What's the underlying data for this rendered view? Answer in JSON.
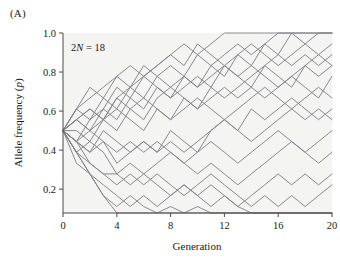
{
  "figure": {
    "panel_label": "(A)",
    "annotation": "2N = 18",
    "annotation_prefix": "2",
    "annotation_var": "N",
    "annotation_suffix": " = 18"
  },
  "chart_data": {
    "type": "line",
    "title": "",
    "xlabel": "Generation",
    "ylabel_prefix": "Allele frequency (",
    "ylabel_var": "p",
    "ylabel_suffix": ")",
    "ylabel": "Allele frequency (p)",
    "annotation": "2N = 18",
    "grid": false,
    "legend": "none",
    "line_color": "#7d7d85",
    "plot_bg": "#f4f4f2",
    "xlim": [
      0,
      20
    ],
    "ylim": [
      0.0778,
      1.0
    ],
    "xticks": [
      0,
      4,
      8,
      12,
      16,
      20
    ],
    "xtick_labels": [
      "0",
      "4",
      "8",
      "12",
      "16",
      "20"
    ],
    "yticks": [
      0.2,
      0.4,
      0.6,
      0.8,
      1.0
    ],
    "ytick_labels": [
      "0.2",
      "0.4",
      "0.6",
      "0.8",
      "1.0"
    ],
    "x": [
      0,
      1,
      2,
      3,
      4,
      5,
      6,
      7,
      8,
      9,
      10,
      11,
      12,
      13,
      14,
      15,
      16,
      17,
      18,
      19,
      20
    ],
    "series": [
      {
        "name": "replicate-1",
        "values": [
          0.5,
          0.611,
          0.667,
          0.722,
          0.778,
          0.833,
          0.778,
          0.833,
          0.889,
          0.944,
          0.889,
          0.944,
          1.0,
          1.0,
          1.0,
          1.0,
          1.0,
          1.0,
          1.0,
          1.0,
          1.0
        ]
      },
      {
        "name": "replicate-2",
        "values": [
          0.5,
          0.556,
          0.611,
          0.556,
          0.667,
          0.722,
          0.667,
          0.778,
          0.833,
          0.778,
          0.889,
          0.833,
          0.889,
          0.944,
          0.889,
          0.944,
          1.0,
          1.0,
          1.0,
          1.0,
          1.0
        ]
      },
      {
        "name": "replicate-3",
        "values": [
          0.5,
          0.611,
          0.556,
          0.667,
          0.611,
          0.722,
          0.778,
          0.722,
          0.667,
          0.778,
          0.722,
          0.833,
          0.778,
          0.889,
          0.833,
          0.944,
          0.889,
          1.0,
          0.944,
          1.0,
          1.0
        ]
      },
      {
        "name": "replicate-4",
        "values": [
          0.5,
          0.444,
          0.556,
          0.611,
          0.722,
          0.667,
          0.778,
          0.833,
          0.889,
          0.833,
          0.944,
          0.889,
          0.833,
          0.889,
          0.944,
          0.889,
          0.833,
          0.889,
          0.944,
          0.889,
          0.944
        ]
      },
      {
        "name": "replicate-5",
        "values": [
          0.5,
          0.556,
          0.5,
          0.611,
          0.556,
          0.667,
          0.611,
          0.722,
          0.667,
          0.722,
          0.778,
          0.722,
          0.833,
          0.778,
          0.722,
          0.833,
          0.889,
          0.833,
          0.889,
          0.833,
          0.889
        ]
      },
      {
        "name": "replicate-6",
        "values": [
          0.5,
          0.611,
          0.722,
          0.667,
          0.778,
          0.722,
          0.833,
          0.778,
          0.722,
          0.667,
          0.611,
          0.722,
          0.667,
          0.722,
          0.778,
          0.833,
          0.778,
          0.722,
          0.833,
          0.889,
          0.833
        ]
      },
      {
        "name": "replicate-7",
        "values": [
          0.5,
          0.444,
          0.5,
          0.556,
          0.5,
          0.611,
          0.556,
          0.667,
          0.722,
          0.778,
          0.722,
          0.778,
          0.833,
          0.778,
          0.833,
          0.778,
          0.722,
          0.778,
          0.833,
          0.778,
          0.833
        ]
      },
      {
        "name": "replicate-8",
        "values": [
          0.5,
          0.556,
          0.611,
          0.556,
          0.667,
          0.611,
          0.667,
          0.611,
          0.556,
          0.667,
          0.611,
          0.667,
          0.722,
          0.667,
          0.722,
          0.667,
          0.722,
          0.778,
          0.722,
          0.667,
          0.778
        ]
      },
      {
        "name": "replicate-9",
        "values": [
          0.5,
          0.5,
          0.444,
          0.556,
          0.611,
          0.556,
          0.5,
          0.611,
          0.556,
          0.611,
          0.667,
          0.611,
          0.556,
          0.611,
          0.667,
          0.722,
          0.667,
          0.611,
          0.667,
          0.722,
          0.667
        ]
      },
      {
        "name": "replicate-10",
        "values": [
          0.5,
          0.444,
          0.389,
          0.5,
          0.444,
          0.389,
          0.444,
          0.389,
          0.5,
          0.444,
          0.389,
          0.5,
          0.556,
          0.5,
          0.611,
          0.556,
          0.611,
          0.667,
          0.611,
          0.556,
          0.611
        ]
      },
      {
        "name": "replicate-11",
        "values": [
          0.5,
          0.556,
          0.5,
          0.444,
          0.389,
          0.444,
          0.389,
          0.444,
          0.389,
          0.333,
          0.389,
          0.444,
          0.389,
          0.333,
          0.389,
          0.444,
          0.5,
          0.444,
          0.389,
          0.444,
          0.5
        ]
      },
      {
        "name": "replicate-12",
        "values": [
          0.5,
          0.444,
          0.389,
          0.444,
          0.333,
          0.389,
          0.444,
          0.389,
          0.444,
          0.389,
          0.444,
          0.5,
          0.556,
          0.5,
          0.444,
          0.5,
          0.556,
          0.611,
          0.556,
          0.611,
          0.556
        ]
      },
      {
        "name": "replicate-13",
        "values": [
          0.5,
          0.389,
          0.444,
          0.389,
          0.278,
          0.333,
          0.278,
          0.333,
          0.389,
          0.333,
          0.278,
          0.333,
          0.278,
          0.222,
          0.278,
          0.333,
          0.389,
          0.444,
          0.389,
          0.333,
          0.389
        ]
      },
      {
        "name": "replicate-14",
        "values": [
          0.5,
          0.389,
          0.333,
          0.278,
          0.278,
          0.222,
          0.278,
          0.222,
          0.167,
          0.222,
          0.167,
          0.222,
          0.167,
          0.111,
          0.167,
          0.222,
          0.278,
          0.222,
          0.278,
          0.222,
          0.278
        ]
      },
      {
        "name": "replicate-15",
        "values": [
          0.5,
          0.444,
          0.333,
          0.278,
          0.222,
          0.278,
          0.222,
          0.278,
          0.222,
          0.167,
          0.222,
          0.278,
          0.222,
          0.167,
          0.111,
          0.167,
          0.111,
          0.167,
          0.111,
          0.167,
          0.222
        ]
      },
      {
        "name": "replicate-16",
        "values": [
          0.5,
          0.389,
          0.278,
          0.222,
          0.167,
          0.111,
          0.167,
          0.111,
          0.167,
          0.222,
          0.167,
          0.111,
          0.167,
          0.111,
          0.056,
          0.0,
          0.0,
          0.0,
          0.0,
          0.0,
          0.0
        ]
      },
      {
        "name": "replicate-17",
        "values": [
          0.5,
          0.333,
          0.278,
          0.167,
          0.111,
          0.167,
          0.111,
          0.056,
          0.111,
          0.056,
          0.111,
          0.056,
          0.0,
          0.0,
          0.0,
          0.0,
          0.0,
          0.0,
          0.0,
          0.0,
          0.0
        ]
      },
      {
        "name": "replicate-18",
        "values": [
          0.5,
          0.389,
          0.278,
          0.167,
          0.056,
          0.0,
          0.0,
          0.0,
          0.0,
          0.0,
          0.0,
          0.0,
          0.0,
          0.0,
          0.0,
          0.0,
          0.0,
          0.0,
          0.0,
          0.0,
          0.0
        ]
      }
    ]
  }
}
